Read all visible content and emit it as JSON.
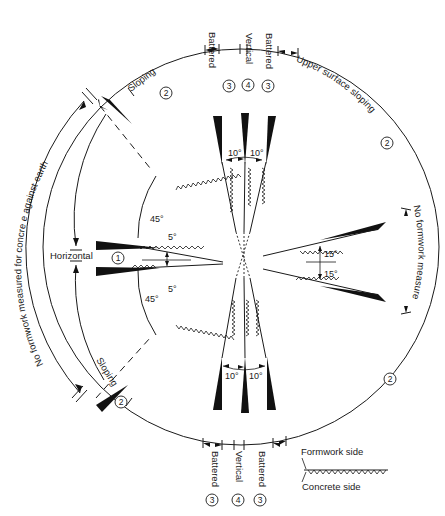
{
  "diagram": {
    "type": "formwork-classification-by-surface-inclination",
    "categories": [
      {
        "id": 1,
        "label": "Horizontal",
        "marker": "1"
      },
      {
        "id": 2,
        "label": "Sloping",
        "marker": "2"
      },
      {
        "id": 3,
        "label": "Battered",
        "marker": "3"
      },
      {
        "id": 4,
        "label": "Vertical",
        "marker": "4"
      }
    ],
    "top_labels": {
      "battered_left": "Battered",
      "vertical": "Vertical",
      "battered_right": "Battered",
      "num_battered_left": "3",
      "num_vertical": "4",
      "num_battered_right": "3"
    },
    "bottom_labels": {
      "battered_left": "Battered",
      "vertical": "Vertical",
      "battered_right": "Battered",
      "num_battered_left": "3",
      "num_vertical": "4",
      "num_battered_right": "3"
    },
    "arc_labels": {
      "sloping_upper": "Sloping",
      "sloping_upper_num": "2",
      "sloping_lower": "Sloping",
      "sloping_lower_num": "2",
      "upper_surface_sloping_top": "Upper surface sloping",
      "upper_surface_sloping_top_num": "2",
      "upper_surface_sloping_bottom": "Upper surface sloping",
      "upper_surface_sloping_bottom_num": "2",
      "no_formwork_measured": "No formwork measured",
      "no_formwork_against_earth": "No formwork measured for concre e against earth",
      "horizontal": "Horizontal",
      "horizontal_num": "1"
    },
    "angles": {
      "left_upper": "45°",
      "left_lower": "45°",
      "left_small_upper": "5°",
      "left_small_lower": "5°",
      "right_upper": "15°",
      "right_lower": "15°",
      "top_left": "10°",
      "top_right": "10°",
      "bottom_left": "10°",
      "bottom_right": "10°"
    },
    "legend": {
      "formwork_side": "Formwork side",
      "concrete_side": "Concrete side"
    }
  }
}
